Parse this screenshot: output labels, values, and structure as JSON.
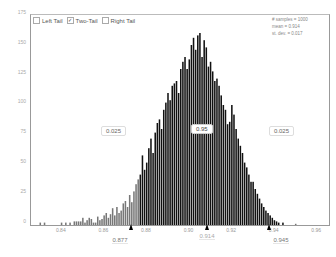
{
  "controls": {
    "left_tail": {
      "label": "Left Tail",
      "checked": false
    },
    "two_tail": {
      "label": "Two-Tail",
      "checked": true
    },
    "right_tail": {
      "label": "Right Tail",
      "checked": false
    }
  },
  "stats": {
    "samples": "# samples = 1000",
    "mean": "mean = 0.914",
    "stdev": "st. dev. = 0.017"
  },
  "regions": {
    "left": "0.025",
    "middle": "0.95",
    "right": "0.025"
  },
  "markers": {
    "lower": "0.877",
    "mean": "0.914",
    "upper": "0.945"
  },
  "chart_data": {
    "type": "bar",
    "title": "",
    "xlabel": "",
    "ylabel": "",
    "xlim": [
      0.826,
      0.966
    ],
    "ylim": [
      0,
      175
    ],
    "yticks": [
      0,
      25,
      50,
      75,
      100,
      125,
      150,
      175
    ],
    "xticks": [
      "0.84",
      "0.86",
      "0.88",
      "0.90",
      "0.92",
      "0.94",
      "0.96"
    ],
    "bin_start": 0.83,
    "bin_width": 0.001,
    "values": [
      2,
      0,
      2,
      0,
      0,
      0,
      0,
      0,
      0,
      0,
      2,
      0,
      2,
      0,
      2,
      0,
      3,
      3,
      3,
      3,
      6,
      2,
      4,
      6,
      5,
      2,
      2,
      7,
      4,
      5,
      8,
      10,
      6,
      9,
      14,
      8,
      15,
      10,
      12,
      18,
      20,
      15,
      25,
      19,
      28,
      34,
      38,
      42,
      58,
      46,
      52,
      64,
      72,
      60,
      77,
      85,
      88,
      80,
      96,
      102,
      110,
      104,
      116,
      118,
      120,
      110,
      130,
      136,
      140,
      130,
      138,
      150,
      156,
      146,
      158,
      160,
      140,
      154,
      148,
      132,
      136,
      128,
      120,
      122,
      116,
      108,
      100,
      96,
      84,
      86,
      100,
      92,
      80,
      72,
      66,
      60,
      52,
      48,
      42,
      36,
      36,
      30,
      26,
      22,
      18,
      15,
      12,
      10,
      8,
      6,
      4,
      3,
      2,
      0,
      2,
      0,
      0,
      0,
      0,
      0,
      1
    ],
    "shaded_regions": [
      {
        "name": "left tail",
        "range": [
          0.826,
          0.877
        ],
        "prob": 0.025
      },
      {
        "name": "middle",
        "range": [
          0.877,
          0.945
        ],
        "prob": 0.95
      },
      {
        "name": "right tail",
        "range": [
          0.945,
          0.966
        ],
        "prob": 0.025
      }
    ],
    "annotations": [
      "0.025",
      "0.95",
      "0.025",
      "0.877",
      "0.914",
      "0.945"
    ],
    "legend": "none",
    "grid": false
  }
}
